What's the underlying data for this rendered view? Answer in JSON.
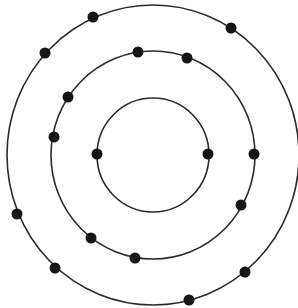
{
  "diagram": {
    "type": "bohr-atom-model",
    "colors": {
      "orbit": "#2a2a2a",
      "electron": "#161616",
      "background": "#ffffff"
    },
    "center": {
      "x": 153,
      "y": 155
    },
    "electron_radius": 5.5,
    "shells": [
      {
        "name": "inner-shell",
        "rx": 56,
        "ry": 57,
        "electron_count": 2,
        "electrons": [
          {
            "x": 97,
            "y": 154
          },
          {
            "x": 208,
            "y": 154
          }
        ]
      },
      {
        "name": "middle-shell",
        "rx": 102,
        "ry": 104,
        "electron_count": 8,
        "electrons": [
          {
            "x": 138,
            "y": 52
          },
          {
            "x": 187,
            "y": 58
          },
          {
            "x": 68,
            "y": 97
          },
          {
            "x": 54,
            "y": 137
          },
          {
            "x": 254,
            "y": 154
          },
          {
            "x": 241,
            "y": 205
          },
          {
            "x": 91,
            "y": 238
          },
          {
            "x": 135,
            "y": 258
          }
        ]
      },
      {
        "name": "outer-shell",
        "rx": 146,
        "ry": 150,
        "electron_count": 7,
        "electrons": [
          {
            "x": 93,
            "y": 17
          },
          {
            "x": 231,
            "y": 28
          },
          {
            "x": 45,
            "y": 53
          },
          {
            "x": 17,
            "y": 214
          },
          {
            "x": 55,
            "y": 268
          },
          {
            "x": 189,
            "y": 300
          },
          {
            "x": 245,
            "y": 272
          }
        ]
      }
    ]
  }
}
